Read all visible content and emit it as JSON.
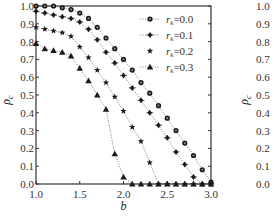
{
  "chart_data": [
    {
      "type": "line",
      "title": "",
      "xlabel": "b",
      "ylabel": "ρc",
      "xlim": [
        1.0,
        3.0
      ],
      "ylim": [
        0.0,
        1.0
      ],
      "grid": false,
      "legend_position": "upper right",
      "x_ticks": [
        "1.0",
        "1.5",
        "2.0",
        "2.5",
        "3.0"
      ],
      "y_ticks": [
        "0.0",
        "0.1",
        "0.2",
        "0.3",
        "0.4",
        "0.5",
        "0.6",
        "0.7",
        "0.8",
        "0.9",
        "1.0"
      ],
      "x": [
        1.0,
        1.1,
        1.2,
        1.3,
        1.4,
        1.5,
        1.6,
        1.7,
        1.8,
        1.9,
        2.0,
        2.1,
        2.2,
        2.3,
        2.4,
        2.5,
        2.6,
        2.7,
        2.8,
        2.9,
        3.0
      ],
      "series": [
        {
          "name": "r_k=0.0",
          "label_main": "r",
          "label_sub": "k",
          "label_val": "=0.0",
          "marker": "circle-dot",
          "values": [
            1.0,
            1.0,
            1.0,
            0.99,
            0.98,
            0.96,
            0.93,
            0.88,
            0.82,
            0.76,
            0.7,
            0.64,
            0.57,
            0.51,
            0.44,
            0.37,
            0.3,
            0.23,
            0.16,
            0.08,
            0.01
          ]
        },
        {
          "name": "r_k=0.1",
          "label_main": "r",
          "label_sub": "k",
          "label_val": "=0.1",
          "marker": "diamond",
          "values": [
            0.97,
            0.96,
            0.95,
            0.94,
            0.93,
            0.91,
            0.87,
            0.81,
            0.74,
            0.68,
            0.61,
            0.54,
            0.47,
            0.4,
            0.33,
            0.26,
            0.18,
            0.11,
            0.04,
            0.0,
            0.0
          ]
        },
        {
          "name": "r_k=0.2",
          "label_main": "r",
          "label_sub": "k",
          "label_val": "=0.2",
          "marker": "star",
          "values": [
            0.88,
            0.87,
            0.86,
            0.85,
            0.83,
            0.77,
            0.71,
            0.64,
            0.57,
            0.49,
            0.41,
            0.32,
            0.24,
            0.12,
            0.0,
            0.0,
            0.0,
            0.0,
            0.0,
            0.0,
            0.0
          ]
        },
        {
          "name": "r_k=0.3",
          "label_main": "r",
          "label_sub": "k",
          "label_val": "=0.3",
          "marker": "triangle",
          "values": [
            0.79,
            0.76,
            0.75,
            0.74,
            0.72,
            0.65,
            0.58,
            0.5,
            0.42,
            0.17,
            0.04,
            0.0,
            0.0,
            0.0,
            0.0,
            0.0,
            0.0,
            0.0,
            0.0,
            0.0,
            0.0
          ]
        }
      ]
    },
    {
      "type": "line",
      "partial": true,
      "xlabel": "",
      "ylabel": "ρc",
      "ylim": [
        0.0,
        1.0
      ],
      "y_ticks": [
        "0.0",
        "0.1",
        "0.2",
        "0.3",
        "0.4",
        "0.5",
        "0.6",
        "0.7",
        "0.8",
        "0.9",
        "1.0"
      ],
      "series": []
    }
  ],
  "axes": {
    "left": {
      "xlabel": "b",
      "ylabel_main": "ρ",
      "ylabel_sub": "c"
    },
    "right": {
      "ylabel_main": "ρ",
      "ylabel_sub": "c"
    }
  },
  "colors": {
    "marker": "#1a1a1a",
    "axis": "#333333",
    "line": "#555555"
  }
}
